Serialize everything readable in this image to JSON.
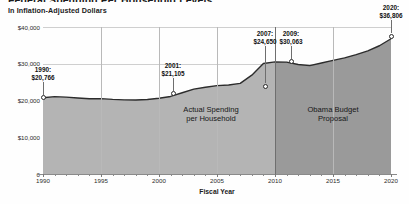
{
  "header": {
    "title": "Federal Spending Per Household Levels",
    "subtitle": "In Inflation-Adjusted Dollars"
  },
  "chart_data": {
    "type": "area",
    "title": "Federal Spending Per Household Levels",
    "subtitle": "In Inflation-Adjusted Dollars",
    "xlabel": "Fiscal Year",
    "ylabel": "",
    "xlim": [
      1990,
      2020
    ],
    "ylim": [
      0,
      40000
    ],
    "grid": true,
    "legend": "none",
    "y_ticks": [
      "0",
      "$10,000",
      "$20,000",
      "$30,000",
      "$40,000"
    ],
    "y_tick_values": [
      0,
      10000,
      20000,
      30000,
      40000
    ],
    "x_ticks": [
      "1990",
      "1995",
      "2000",
      "2005",
      "2010",
      "2015",
      "2020"
    ],
    "x_tick_values": [
      1990,
      1995,
      2000,
      2005,
      2010,
      2015,
      2020
    ],
    "series": [
      {
        "name": "Federal spending per household",
        "x": [
          1990,
          1991,
          1992,
          1993,
          1994,
          1995,
          1996,
          1997,
          1998,
          1999,
          2000,
          2001,
          2002,
          2003,
          2004,
          2005,
          2006,
          2007,
          2008,
          2009,
          2010,
          2011,
          2012,
          2013,
          2014,
          2015,
          2016,
          2017,
          2018,
          2019,
          2020
        ],
        "values": [
          20766,
          21050,
          20930,
          20700,
          20480,
          20520,
          20300,
          20180,
          20150,
          20260,
          20600,
          21105,
          22100,
          23100,
          23600,
          24050,
          24200,
          24650,
          26900,
          30063,
          30500,
          30450,
          29800,
          29500,
          30200,
          30900,
          31600,
          32500,
          33500,
          34900,
          36806
        ]
      }
    ],
    "annotations": [
      {
        "year": 1990,
        "label": "1990:",
        "value": "$20,766",
        "amount": 20766
      },
      {
        "year": 2001,
        "label": "2001:",
        "value": "$21,105",
        "amount": 21105
      },
      {
        "year": 2007,
        "label": "2007:",
        "value": "$24,650",
        "amount": 24650
      },
      {
        "year": 2009,
        "label": "2009:",
        "value": "$30,063",
        "amount": 30063
      },
      {
        "year": 2020,
        "label": "2020:",
        "value": "$36,806",
        "amount": 36806
      }
    ],
    "bands": [
      {
        "name": "actual",
        "label_line1": "Actual Spending",
        "label_line2": "per Household",
        "start": 1990,
        "end": 2010,
        "color": "#b4b4b4"
      },
      {
        "name": "proposal",
        "label_line1": "Obama Budget",
        "label_line2": "Proposal",
        "start": 2010,
        "end": 2020,
        "color": "#9a9a9a"
      }
    ],
    "colors": {
      "area_actual": "#b4b4b4",
      "area_proposal": "#9a9a9a",
      "line": "#2c2c2c",
      "grid": "#cfcfcf",
      "axis": "#8a8a8a"
    }
  }
}
